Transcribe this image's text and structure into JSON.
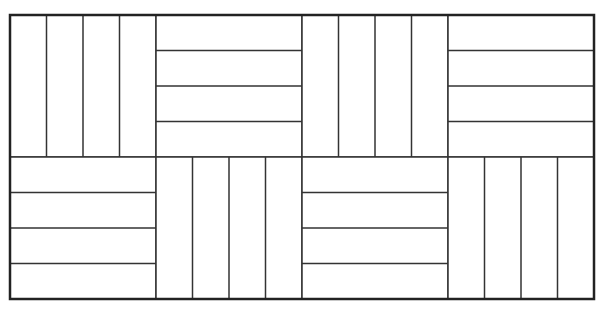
{
  "diagram": {
    "type": "parquet-basketweave-pattern",
    "frame": {
      "x": 10,
      "y": 15,
      "width": 584,
      "height": 284,
      "stroke": "#222222"
    },
    "grid": {
      "rows": 2,
      "cols": 4
    },
    "line_color": "#333333",
    "fill": "#ffffff",
    "strips_per_block": 4,
    "blocks": [
      {
        "row": 0,
        "col": 0,
        "orientation": "vertical"
      },
      {
        "row": 0,
        "col": 1,
        "orientation": "horizontal"
      },
      {
        "row": 0,
        "col": 2,
        "orientation": "vertical"
      },
      {
        "row": 0,
        "col": 3,
        "orientation": "horizontal"
      },
      {
        "row": 1,
        "col": 0,
        "orientation": "horizontal"
      },
      {
        "row": 1,
        "col": 1,
        "orientation": "vertical"
      },
      {
        "row": 1,
        "col": 2,
        "orientation": "horizontal"
      },
      {
        "row": 1,
        "col": 3,
        "orientation": "vertical"
      }
    ]
  }
}
